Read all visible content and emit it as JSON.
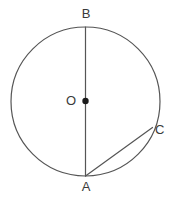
{
  "diagram": {
    "type": "circle-geometry",
    "background_color": "#ffffff",
    "stroke_color": "#555555",
    "label_color": "#3a3a3a",
    "stroke_width": 1.2,
    "circle": {
      "center_x": 85.5,
      "center_y": 101.5,
      "radius": 74.5
    },
    "center_dot": {
      "cx": 85.5,
      "cy": 101.0,
      "r": 3.2
    },
    "points": {
      "A": {
        "x": 85.5,
        "y": 176.0
      },
      "B": {
        "x": 85.5,
        "y": 27.0
      },
      "C": {
        "x": 152.5,
        "y": 127.5
      },
      "O": {
        "x": 85.5,
        "y": 101.5
      }
    },
    "segments": [
      {
        "name": "diameter-AB",
        "from": "B",
        "to": "A",
        "x1": 85.5,
        "y1": 27.0,
        "x2": 85.5,
        "y2": 176.0
      },
      {
        "name": "chord-AC",
        "from": "A",
        "to": "C",
        "x1": 85.5,
        "y1": 176.0,
        "x2": 152.5,
        "y2": 127.5
      }
    ],
    "labels": {
      "A": "A",
      "B": "B",
      "C": "C",
      "O": "O"
    }
  }
}
